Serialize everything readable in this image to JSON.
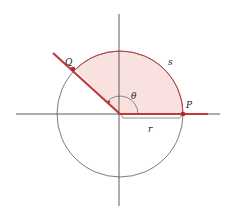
{
  "diagram": {
    "labels": {
      "Q": "Q",
      "P": "P",
      "theta": "θ",
      "s": "s",
      "r": "r"
    },
    "colors": {
      "axis": "#333333",
      "circle": "#444444",
      "sector_fill": "#f9e1df",
      "arc_and_rays": "#c0393b",
      "point": "#b0262b"
    },
    "geometry": {
      "origin": [
        120,
        114
      ],
      "radius": 63,
      "angle_degrees": 135
    }
  }
}
